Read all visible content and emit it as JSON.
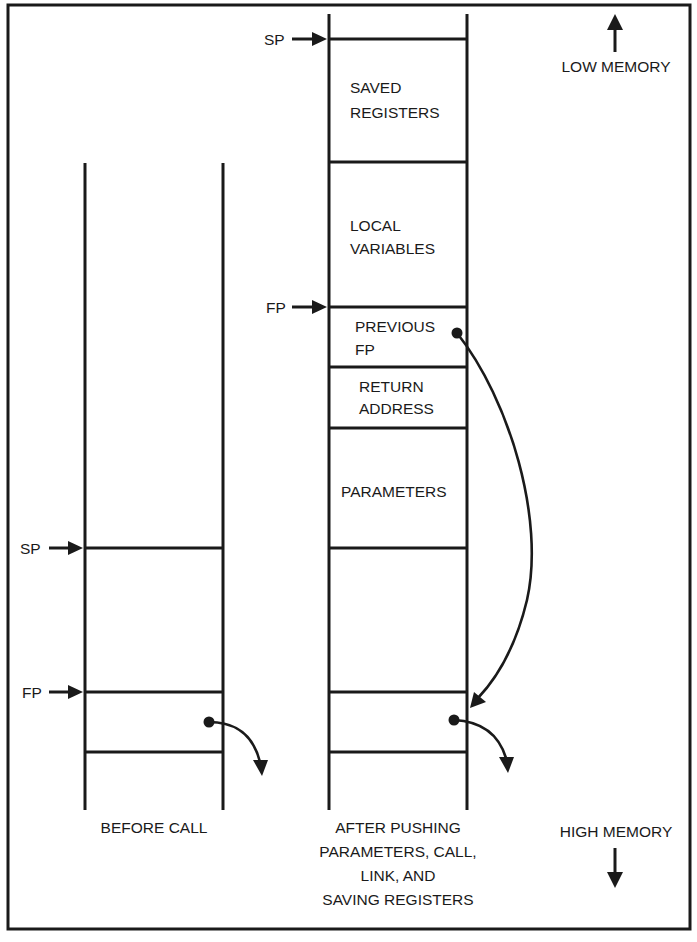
{
  "diagram": {
    "orientation": {
      "top_label": "LOW MEMORY",
      "bottom_label": "HIGH MEMORY"
    },
    "before_call": {
      "caption": "BEFORE CALL",
      "pointers": {
        "sp": "SP",
        "fp": "FP"
      }
    },
    "after_call": {
      "caption_lines": [
        "AFTER PUSHING",
        "PARAMETERS, CALL,",
        "LINK, AND",
        "SAVING REGISTERS"
      ],
      "pointers": {
        "sp": "SP",
        "fp": "FP"
      },
      "cells": [
        {
          "lines": [
            "SAVED",
            "REGISTERS"
          ]
        },
        {
          "lines": [
            "LOCAL",
            "VARIABLES"
          ]
        },
        {
          "lines": [
            "PREVIOUS",
            "FP"
          ]
        },
        {
          "lines": [
            "RETURN",
            "ADDRESS"
          ]
        },
        {
          "lines": [
            "PARAMETERS"
          ]
        }
      ]
    }
  },
  "colors": {
    "ink": "#1a1a1a",
    "background": "#ffffff"
  }
}
